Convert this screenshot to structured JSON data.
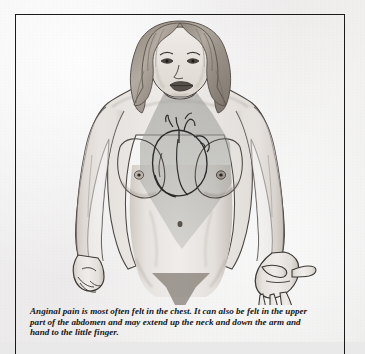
{
  "figure": {
    "caption": "Anginal pain is most often felt in the chest. It can also be felt in the upper part of the abdomen and may extend up the neck and down the arm and hand to the little finger.",
    "drawing_style": "pencil and ink medical illustration, grey wash shading",
    "pain_region": {
      "label": "shaded pain referral area",
      "description": "grey wedge covering neck, chest and upper abdomen, tapering to a point below the navel",
      "fill_color": "#a9a9a4",
      "opacity": "0.55"
    },
    "organ_overlay": {
      "name": "heart-outline",
      "label": "anatomical heart with great vessels",
      "stroke_color": "#2a2a2a"
    },
    "colors": {
      "paper": "#f1efee",
      "ink": "#1a1a1a",
      "skin_light": "#e4e0dc",
      "skin_shadow": "#b9b2ab",
      "shading": "#a9a9a4",
      "hair": "#9d958c",
      "frame": "#1a1a1a"
    },
    "labels": {
      "head": "head",
      "hair": "hair",
      "neck": "neck",
      "left_arm": "left-arm",
      "right_arm": "right-arm",
      "left_hand": "left-hand",
      "right_hand": "right-hand",
      "torso": "torso",
      "navel": "navel"
    }
  }
}
